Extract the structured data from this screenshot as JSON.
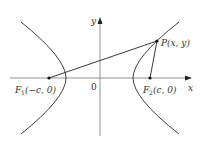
{
  "diagram": {
    "type": "hyperbola-foci",
    "colors": {
      "stroke": "#2a2a2a",
      "axis": "#6a6a6a",
      "text": "#333333"
    },
    "axes": {
      "x_label": "x",
      "y_label": "y",
      "origin_label": "0"
    },
    "points": {
      "F1": {
        "name": "F",
        "sub": "1",
        "coords": "(−c, 0)"
      },
      "F2": {
        "name": "F",
        "sub": "2",
        "coords": "(c, 0)"
      },
      "P": {
        "name": "P",
        "coords": "(x, y)"
      }
    }
  }
}
